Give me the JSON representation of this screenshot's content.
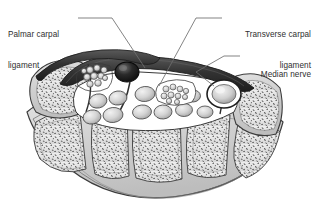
{
  "figure": {
    "background_color": "#ffffff",
    "line_color": "#3a3a3a",
    "label_color": "#2f2f2f",
    "bone_fill": "#e8e8e8",
    "tendon_fill": "#d0d0d0",
    "ligament_fill": "#4a4a4a",
    "artery_fill": "#1a1a1a"
  },
  "labels": {
    "palmar": {
      "line1": "Palmar carpal",
      "line2": "ligament"
    },
    "transverse": {
      "line1": "Transverse carpal",
      "line2": "ligament"
    },
    "median": {
      "line1": "Median nerve"
    }
  },
  "structures": [
    {
      "name": "palmar-carpal-ligament",
      "kind": "ligament"
    },
    {
      "name": "transverse-carpal-ligament",
      "kind": "ligament"
    },
    {
      "name": "median-nerve",
      "kind": "nerve"
    },
    {
      "name": "ulnar-nerve-bundle",
      "kind": "nerve-fascicle-cluster"
    },
    {
      "name": "ulnar-artery",
      "kind": "artery"
    },
    {
      "name": "flexor-tendons",
      "kind": "tendon-group"
    },
    {
      "name": "carpal-bones",
      "kind": "bone-row"
    }
  ]
}
